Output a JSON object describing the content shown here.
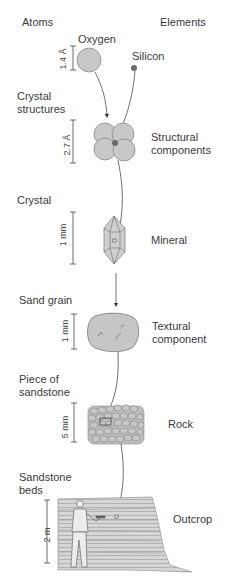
{
  "header": {
    "left": "Atoms",
    "right": "Elements"
  },
  "levels": [
    {
      "left_label": "",
      "scale": "1.4 Å",
      "right_label": "",
      "item_a": "Oxygen",
      "item_b": "Silicon"
    },
    {
      "left_label_lines": [
        "Crystal",
        "structures"
      ],
      "scale": "2.7 Å",
      "right_label_lines": [
        "Structural",
        "components"
      ]
    },
    {
      "left_label": "Crystal",
      "scale": "1 mm",
      "right_label": "Mineral"
    },
    {
      "left_label": "Sand grain",
      "scale": "1 mm",
      "right_label_lines": [
        "Textural",
        "component"
      ]
    },
    {
      "left_label_lines": [
        "Piece of",
        "sandstone"
      ],
      "scale": "5 mm",
      "right_label": "Rock"
    },
    {
      "left_label_lines": [
        "Sandstone",
        "beds"
      ],
      "scale": "2 m",
      "right_label": "Outcrop"
    }
  ],
  "colors": {
    "fill": "#c8c8c8",
    "stroke": "#7a7a7a",
    "dark": "#6a6a6a",
    "text": "#3a3a3a"
  }
}
